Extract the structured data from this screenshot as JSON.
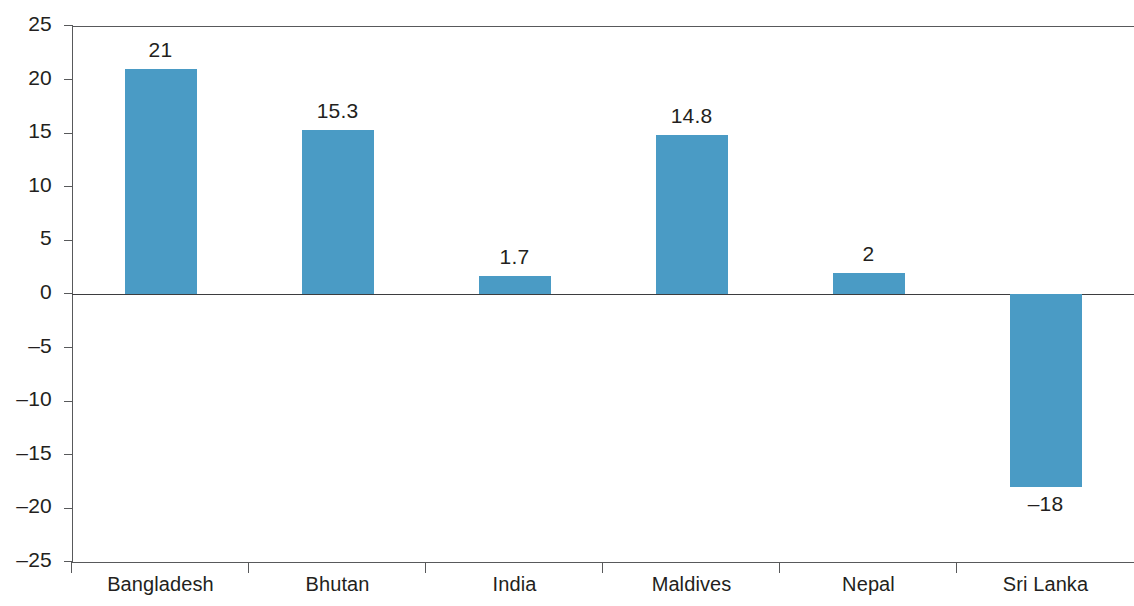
{
  "chart_data": {
    "type": "bar",
    "title": "",
    "subtitle": "",
    "xlabel": "",
    "ylabel": "",
    "categories": [
      "Bangladesh",
      "Bhutan",
      "India",
      "Maldives",
      "Nepal",
      "Sri Lanka"
    ],
    "values": [
      21,
      15.3,
      1.7,
      14.8,
      2,
      -18
    ],
    "value_labels": [
      "21",
      "15.3",
      "1.7",
      "14.8",
      "2",
      "–18"
    ],
    "ylim": [
      -25,
      25
    ],
    "ytick_values": [
      25,
      20,
      15,
      10,
      5,
      0,
      -5,
      -10,
      -15,
      -20,
      -25
    ],
    "ytick_labels": [
      "25",
      "20",
      "15",
      "10",
      "5",
      "0",
      "–5",
      "–10",
      "–15",
      "–20",
      "–25"
    ],
    "grid": false,
    "legend": null,
    "legend_position": "none",
    "bar_color": "#4a9bc5",
    "axis_color": "#58595b",
    "text_color": "#231f20",
    "background_color": "#ffffff"
  }
}
